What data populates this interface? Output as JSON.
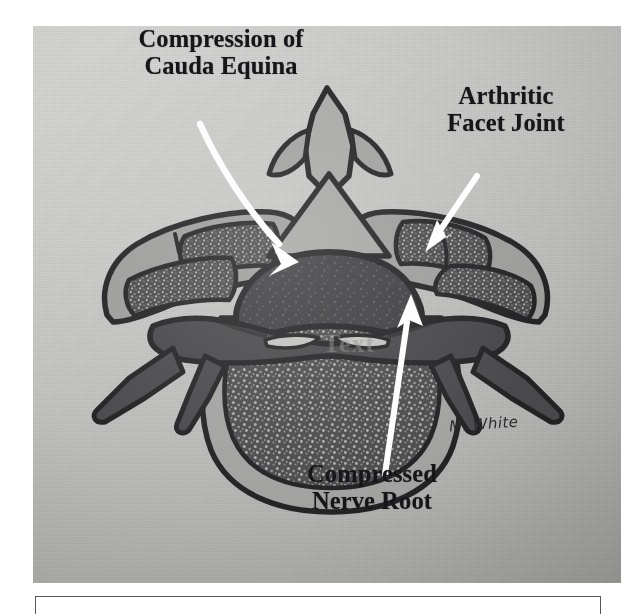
{
  "figure": {
    "background_color": "#c4c4c2",
    "labels": [
      {
        "id": "cauda-equina",
        "text": "Compression of\nCauda Equina",
        "color": "#16161a"
      },
      {
        "id": "facet-joint",
        "text": "Arthritic\nFacet Joint",
        "color": "#16161a"
      },
      {
        "id": "nerve-root",
        "text": "Compressed\nNerve Root",
        "color": "#16161a"
      }
    ],
    "annotations": {
      "arrow_color": "#fdfdfd",
      "arrow_count": 3,
      "arrows": [
        {
          "id": "arrow-cauda-equina",
          "style": "curved",
          "points_to": "spinal canal"
        },
        {
          "id": "arrow-facet-joint",
          "style": "straight",
          "points_to": "right facet joint"
        },
        {
          "id": "arrow-nerve-root",
          "style": "straight",
          "points_to": "compressed nerve root"
        }
      ]
    },
    "watermark": "Text",
    "signature": "M. White",
    "anatomy_colors": {
      "outline": "#232325",
      "bone_cortex": "#9a9a98",
      "trabecular_bone": "#4e4e50",
      "dural_sac": "#3e3e40",
      "nerve_tissue": "#4a4a4c",
      "cartilage": "#7e7e7f"
    }
  },
  "caption_box": {
    "text": "",
    "border_color": "#55555a"
  }
}
